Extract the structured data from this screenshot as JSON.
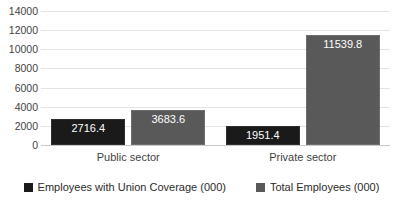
{
  "chart_data": {
    "type": "bar",
    "title": "",
    "xlabel": "",
    "ylabel": "",
    "categories": [
      "Public sector",
      "Private sector"
    ],
    "series": [
      {
        "name": "Employees with Union Coverage (000)",
        "color": "#1A1A1A",
        "values": [
          2716.4,
          1951.4
        ],
        "labels": [
          "2716.4",
          "1951.4"
        ]
      },
      {
        "name": "Total Employees (000)",
        "color": "#595959",
        "values": [
          3683.6,
          11539.8
        ],
        "labels": [
          "3683.6",
          "11539.8"
        ]
      }
    ],
    "ylim": [
      0,
      14000
    ],
    "ytick_step": 2000,
    "ytick_labels": [
      "14000",
      "12000",
      "10000",
      "8000",
      "6000",
      "4000",
      "2000",
      "0"
    ],
    "grid": true,
    "grid_axis": "y",
    "legend_position": "bottom",
    "data_labels": true,
    "plot_background": "#FFFFFF",
    "gridline_color": "#E4E4E4"
  },
  "legend": {
    "items": [
      {
        "label": "Employees with Union Coverage (000)",
        "swatch": "#1A1A1A"
      },
      {
        "label": "Total Employees (000)",
        "swatch": "#595959"
      }
    ]
  },
  "cropped": {
    "title_fragment": "",
    "footer_fragment": ""
  }
}
